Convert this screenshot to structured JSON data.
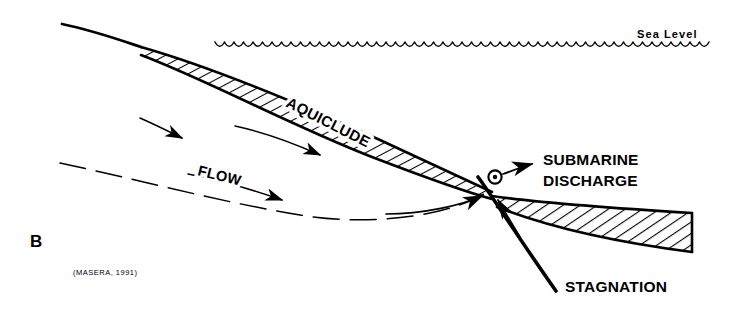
{
  "figure": {
    "panel_label": "B",
    "citation": "(MASERA, 1991)",
    "type": "cross-section-diagram"
  },
  "labels": {
    "sea_level": "Sea Level",
    "aquiclude": "AQUICLUDE",
    "flow": "FLOW",
    "submarine_discharge_line1": "SUBMARINE",
    "submarine_discharge_line2": "DISCHARGE",
    "stagnation": "STAGNATION"
  },
  "icons": {
    "discharge_point": "circle-dot-out-of-page-icon",
    "flow_arrow": "arrow-right-icon",
    "discharge_arrow": "arrow-up-right-icon",
    "stagnation_arrow": "arrow-up-left-icon"
  },
  "colors": {
    "ink": "#000000",
    "background": "#ffffff"
  },
  "geometry": {
    "canvas_width": 743,
    "canvas_height": 315,
    "sea_level_y": 42,
    "sea_level_x_start": 215,
    "sea_level_x_end": 716,
    "wave_period": 19,
    "wave_depth": 6,
    "land_surface_start": [
      62,
      24
    ],
    "aquiclude_pinch_x": 140,
    "discharge_point": [
      495,
      177
    ],
    "fault_junction": [
      492,
      193
    ],
    "aquiclude_right_edge_x": 692,
    "stagnation_line_end": [
      556,
      291
    ]
  }
}
